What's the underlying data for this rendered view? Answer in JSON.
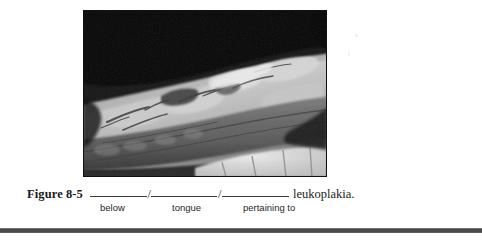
{
  "page": {
    "background_color": "#ffffff",
    "width": 482,
    "height": 240
  },
  "figure": {
    "label": "Figure 8-5",
    "photo": {
      "alt_name": "clinical-photograph-ventral-tongue-leukoplakia",
      "description": "Grayscale intraoral clinical photograph of the ventral surface of the tongue showing irregular white plaque (leukoplakia) with lower teeth visible at bottom right",
      "border_color": "#000000",
      "is_grayscale": true
    },
    "caption": {
      "blanks": [
        {
          "hint": "below",
          "answer_slot": ""
        },
        {
          "hint": "tongue",
          "answer_slot": ""
        },
        {
          "hint": "pertaining to",
          "answer_slot": ""
        }
      ],
      "separator": "/",
      "trailing_term": "leukoplakia.",
      "full_text": "Figure 8-5 __________/___________/___________ leukoplakia."
    }
  },
  "divider": {
    "name": "section-divider-bar",
    "color": "#4a4a4a"
  },
  "artifacts": {
    "scan_speck_1": "faint-scan-speck",
    "scan_speck_2": "faint-scan-speck"
  }
}
